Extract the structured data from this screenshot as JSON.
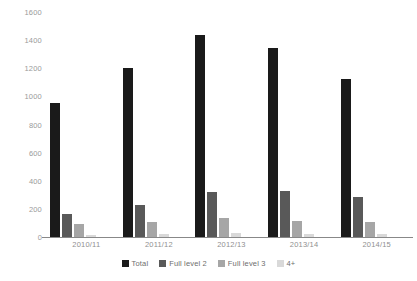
{
  "chart_data": {
    "type": "bar",
    "title": "",
    "xlabel": "",
    "ylabel": "",
    "ylim": [
      0,
      1600
    ],
    "yticks": [
      0,
      200,
      400,
      600,
      800,
      1000,
      1200,
      1400,
      1600
    ],
    "grid": false,
    "legend_position": "bottom",
    "categories": [
      "2010/11",
      "2011/12",
      "2012/13",
      "2013/14",
      "2014/15"
    ],
    "series": [
      {
        "name": "Total",
        "color": "#1a1a1a",
        "values": [
          950,
          1200,
          1435,
          1345,
          1125
        ]
      },
      {
        "name": "Full level 2",
        "color": "#595959",
        "values": [
          165,
          225,
          320,
          330,
          285
        ]
      },
      {
        "name": "Full level 3",
        "color": "#a6a6a6",
        "values": [
          95,
          110,
          135,
          115,
          110
        ]
      },
      {
        "name": "4+",
        "color": "#d9d9d9",
        "values": [
          15,
          20,
          25,
          20,
          20
        ]
      }
    ]
  },
  "footnote": {
    "text": ""
  }
}
